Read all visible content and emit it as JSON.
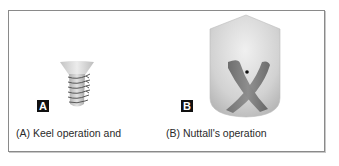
{
  "figure": {
    "panels": [
      {
        "id": "A",
        "badge_label": "A",
        "caption": "(A) Keel operation and",
        "illustration": "keel-funnel-sutures"
      },
      {
        "id": "B",
        "badge_label": "B",
        "caption": "(B) Nuttall's operation",
        "illustration": "crossed-muscle-shield"
      }
    ],
    "colors": {
      "frame_border": "#8a8a8a",
      "badge_bg": "#111111",
      "badge_text": "#ffffff",
      "caption_text": "#2a2a2a",
      "funnel_fill": "#d9d9d9",
      "suture_stroke": "#4a4a4a",
      "shield_fill": "#d4d4d4",
      "muscle_fill": "#7a7a7a",
      "dot": "#111111"
    }
  }
}
